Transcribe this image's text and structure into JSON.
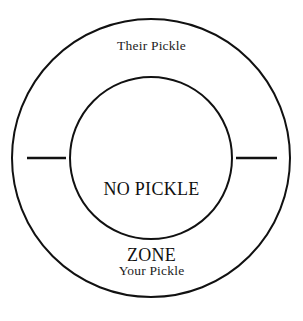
{
  "diagram": {
    "title": "No Pickle Zone",
    "type": "concentric-circle-diagram",
    "background_color": "#ffffff",
    "stroke_color": "#111111",
    "outer_ring": {
      "label": "Their Pickle",
      "bottom_label": "Your Pickle"
    },
    "inner_circle": {
      "line1": "NO PICKLE",
      "line2": "ZONE"
    },
    "ticks": {
      "left": "left-tick-mark",
      "right": "right-tick-mark"
    },
    "geometry": {
      "center_x": 151,
      "center_y": 158,
      "outer_radius": 139,
      "inner_radius": 81,
      "stroke_width": 2,
      "left_tick_x1": 27,
      "left_tick_x2": 66,
      "right_tick_x1": 236,
      "right_tick_x2": 277,
      "tick_y": 158
    }
  }
}
